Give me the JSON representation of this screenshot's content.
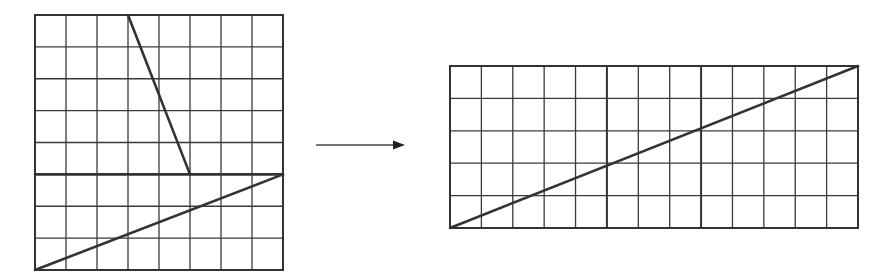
{
  "diagram": {
    "colors": {
      "line": "#333333",
      "grid": "#3a3a3a",
      "background": "#ffffff"
    },
    "left_figure": {
      "name": "square",
      "cols": 8,
      "rows": 8,
      "box": {
        "x": 35,
        "y": 15,
        "w": 248,
        "h": 255
      },
      "cuts": [
        {
          "name": "horizontal-cut",
          "from": [
            0,
            5
          ],
          "to": [
            8,
            5
          ]
        },
        {
          "name": "upper-slant-cut",
          "from": [
            3,
            0
          ],
          "to": [
            5,
            5
          ]
        },
        {
          "name": "lower-diagonal-cut",
          "from": [
            0,
            8
          ],
          "to": [
            8,
            5
          ]
        }
      ]
    },
    "arrow": {
      "name": "transform-arrow",
      "x1": 316,
      "x2": 405,
      "y": 145
    },
    "right_figure": {
      "name": "rectangle",
      "cols": 13,
      "rows": 5,
      "box": {
        "x": 450,
        "y": 66,
        "w": 408,
        "h": 162
      },
      "seams": [
        5,
        8
      ],
      "cuts": [
        {
          "name": "main-diagonal",
          "from": [
            0,
            5
          ],
          "to": [
            13,
            0
          ]
        }
      ]
    }
  }
}
